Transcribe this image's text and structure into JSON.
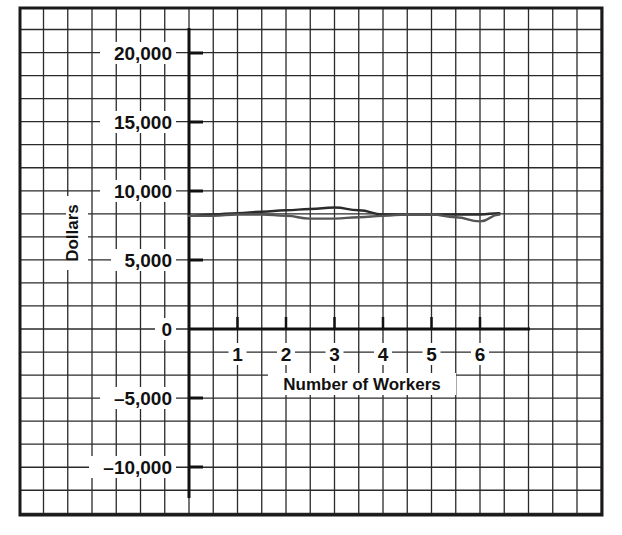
{
  "chart_data": {
    "type": "line",
    "title": "",
    "xlabel": "Number of Workers",
    "ylabel": "Dollars",
    "x_ticks": [
      "1",
      "2",
      "3",
      "4",
      "5",
      "6"
    ],
    "y_ticks": [
      "20,000",
      "15,000",
      "10,000",
      "5,000",
      "0",
      "–5,000",
      "–10,000"
    ],
    "y_tick_values": [
      20000,
      15000,
      10000,
      5000,
      0,
      -5000,
      -10000
    ],
    "xlim": [
      0,
      7
    ],
    "ylim": [
      -12500,
      22500
    ],
    "grid": true,
    "legend": null,
    "series": [
      {
        "name": "upper hand-drawn line",
        "x": [
          0,
          0.5,
          1,
          1.5,
          2,
          2.5,
          3,
          3.5,
          4,
          4.5,
          5,
          5.5,
          6,
          6.4
        ],
        "values": [
          8200,
          8300,
          8400,
          8500,
          8600,
          8700,
          8800,
          8600,
          8300,
          8300,
          8300,
          8300,
          8300,
          8400
        ]
      },
      {
        "name": "lower hand-drawn line",
        "x": [
          0,
          0.5,
          1,
          1.5,
          2,
          2.5,
          3,
          3.5,
          4,
          4.5,
          5,
          5.5,
          6,
          6.4
        ],
        "values": [
          8200,
          8200,
          8300,
          8300,
          8200,
          8000,
          8000,
          8100,
          8200,
          8300,
          8300,
          8100,
          7800,
          8300
        ]
      }
    ]
  },
  "axes": {
    "x_label": "Number of Workers",
    "y_label": "Dollars",
    "x_tick_labels": [
      "1",
      "2",
      "3",
      "4",
      "5",
      "6"
    ],
    "y_tick_labels": [
      "20,000",
      "15,000",
      "10,000",
      "5,000",
      "0",
      "–5,000",
      "–10,000"
    ]
  },
  "colors": {
    "grid": "#2a2a2a",
    "line": "#333333",
    "background": "#ffffff"
  }
}
